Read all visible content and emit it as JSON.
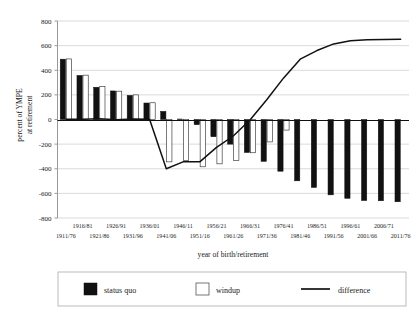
{
  "chart_data": {
    "type": "bar",
    "title": "",
    "subtitle": "",
    "xlabel": "year of birth/retirement",
    "ylabel_line1": "percent of YMPE",
    "ylabel_line2": "at retirement",
    "ylabel": "percent of YMPE at retirement",
    "ylim": [
      -800,
      800
    ],
    "ytick_values": [
      800,
      600,
      400,
      200,
      0,
      -200,
      -400,
      -600,
      -800
    ],
    "ytick_labels": [
      "800",
      "600",
      "400",
      "200",
      "0",
      "-200",
      "-400",
      "-600",
      "-800"
    ],
    "grid": true,
    "grid_axis": "y",
    "legend_position": "bottom",
    "categories": [
      "1911/76",
      "1916/81",
      "1921/86",
      "1926/91",
      "1931/96",
      "1936/01",
      "1941/06",
      "1946/11",
      "1951/16",
      "1956/21",
      "1961/26",
      "1966/31",
      "1971/36",
      "1976/41",
      "1981/46",
      "1986/51",
      "1991/56",
      "1996/61",
      "2001/66",
      "2006/71",
      "2011/76"
    ],
    "xtick_labels_upper": [
      "1916/81",
      "1926/91",
      "1936/01",
      "1946/11",
      "1956/21",
      "1966/31",
      "1976/41",
      "1986/51",
      "1996/61",
      "2006/71"
    ],
    "xtick_labels_lower": [
      "1911/76",
      "1921/86",
      "1931/96",
      "1941/06",
      "1951/16",
      "1961/26",
      "1971/36",
      "1981/46",
      "1991/56",
      "2001/66",
      "2011/76"
    ],
    "series": [
      {
        "name": "status quo",
        "kind": "bar",
        "color": "#111111",
        "values": [
          490,
          358,
          262,
          232,
          196,
          134,
          66,
          4,
          -42,
          -140,
          -200,
          -268,
          -340,
          -420,
          -498,
          -552,
          -612,
          -640,
          -658,
          -660,
          -668
        ]
      },
      {
        "name": "windup",
        "kind": "bar",
        "color": "#ffffff",
        "values": [
          492,
          360,
          268,
          230,
          200,
          136,
          -344,
          -332,
          -384,
          -360,
          -332,
          -270,
          -182,
          -86,
          0,
          0,
          0,
          0,
          0,
          0,
          0
        ]
      },
      {
        "name": "difference",
        "kind": "line",
        "color": "#111111",
        "values": [
          2,
          2,
          6,
          -2,
          4,
          2,
          -400,
          -344,
          -344,
          -226,
          -134,
          -4,
          160,
          336,
          490,
          560,
          614,
          640,
          648,
          650,
          652
        ]
      }
    ],
    "legend_entries": [
      {
        "label": "status quo",
        "marker": "filled-square",
        "color": "#111111"
      },
      {
        "label": "windup",
        "marker": "open-square",
        "color": "#ffffff"
      },
      {
        "label": "difference",
        "marker": "line",
        "color": "#111111"
      }
    ]
  }
}
